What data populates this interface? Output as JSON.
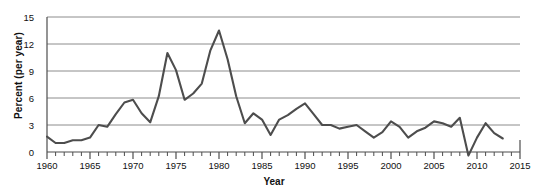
{
  "chart_data": {
    "type": "line",
    "title": "",
    "xlabel": "Year",
    "ylabel": "Percent (per year)",
    "xlim": [
      1960,
      2015
    ],
    "ylim": [
      0,
      15
    ],
    "yticks": [
      0,
      3,
      6,
      9,
      12,
      15
    ],
    "xticks": [
      1960,
      1965,
      1970,
      1975,
      1980,
      1985,
      1990,
      1995,
      2000,
      2005,
      2010,
      2015
    ],
    "xtick_labels": [
      "1960",
      "1965",
      "1970",
      "1975",
      "1980",
      "1985",
      "1990",
      "1995",
      "2000",
      "2005",
      "2010",
      "2015"
    ],
    "ytick_labels": [
      "0",
      "3",
      "6",
      "9",
      "12",
      "15"
    ],
    "minor_xtick_interval": 1,
    "grid": "horizontal",
    "legend": "none",
    "line_color": "#4d4d4d",
    "grid_color": "#8c8c8c",
    "axis_color": "#4d4d4d",
    "x": [
      1960,
      1961,
      1962,
      1963,
      1964,
      1965,
      1966,
      1967,
      1968,
      1969,
      1970,
      1971,
      1972,
      1973,
      1974,
      1975,
      1976,
      1977,
      1978,
      1979,
      1980,
      1981,
      1982,
      1983,
      1984,
      1985,
      1986,
      1987,
      1988,
      1989,
      1990,
      1991,
      1992,
      1993,
      1994,
      1995,
      1996,
      1997,
      1998,
      1999,
      2000,
      2001,
      2002,
      2003,
      2004,
      2005,
      2006,
      2007,
      2008,
      2009,
      2010,
      2011,
      2012,
      2013
    ],
    "values": [
      1.7,
      1.0,
      1.0,
      1.3,
      1.3,
      1.6,
      3.0,
      2.8,
      4.2,
      5.5,
      5.8,
      4.3,
      3.3,
      6.2,
      11.0,
      9.1,
      5.8,
      6.5,
      7.6,
      11.3,
      13.5,
      10.3,
      6.2,
      3.2,
      4.3,
      3.6,
      1.9,
      3.6,
      4.1,
      4.8,
      5.4,
      4.2,
      3.0,
      3.0,
      2.6,
      2.8,
      3.0,
      2.3,
      1.6,
      2.2,
      3.4,
      2.8,
      1.6,
      2.3,
      2.7,
      3.4,
      3.2,
      2.8,
      3.8,
      -0.4,
      1.6,
      3.2,
      2.1,
      1.5
    ],
    "annotations": []
  }
}
